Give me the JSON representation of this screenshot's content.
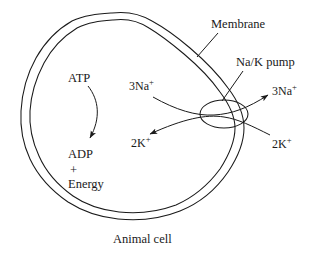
{
  "figure": {
    "caption": "Animal cell",
    "title": "Animal cell",
    "line_color": "#1a1a1a",
    "background_color": "#ffffff"
  },
  "labels": {
    "membrane": "Membrane",
    "na_k_pump": "Na/K pump",
    "atp": "ATP",
    "adp": "ADP",
    "plus": "+",
    "energy": "Energy",
    "sodium_inside": {
      "prefix": "3Na",
      "charge": "+"
    },
    "potassium_inside": {
      "prefix": "2K",
      "charge": "+"
    },
    "sodium_outside": {
      "prefix": "3Na",
      "charge": "+"
    },
    "potassium_outside": {
      "prefix": "2K",
      "charge": "+"
    }
  },
  "diagram_data": {
    "type": "diagram",
    "subject": "Sodium-potassium pump in an animal cell membrane",
    "structures": [
      {
        "name": "cell-membrane",
        "shape": "double irregular closed curve",
        "note": "two parallel outlines forming a lipid bilayer"
      },
      {
        "name": "na-k-pump",
        "shape": "ellipse",
        "note": "straddles the membrane"
      }
    ],
    "reactions": [
      {
        "name": "atp-hydrolysis",
        "from": "ATP",
        "to": "ADP + Energy",
        "direction": "downward curved arrow"
      }
    ],
    "transports": [
      {
        "name": "sodium-efflux",
        "species": "3Na+",
        "from": "inside",
        "to": "outside",
        "arrow": "to outside, arrowhead at upper right"
      },
      {
        "name": "potassium-influx",
        "species": "2K+",
        "from": "outside",
        "to": "inside",
        "arrow": "to inside, arrowhead at lower left"
      }
    ]
  }
}
